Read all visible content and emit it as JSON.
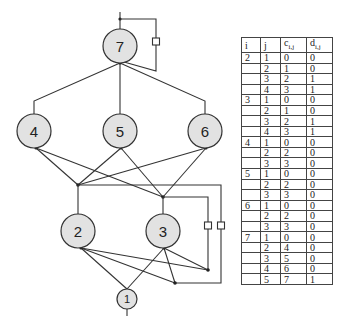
{
  "diagram": {
    "nodes": [
      {
        "id": "7",
        "label": "7",
        "cx": 120,
        "cy": 46,
        "r": 17
      },
      {
        "id": "4",
        "label": "4",
        "cx": 34,
        "cy": 131,
        "r": 17
      },
      {
        "id": "5",
        "label": "5",
        "cx": 120,
        "cy": 131,
        "r": 17
      },
      {
        "id": "6",
        "label": "6",
        "cx": 205,
        "cy": 131,
        "r": 17
      },
      {
        "id": "2",
        "label": "2",
        "cx": 78,
        "cy": 231,
        "r": 17
      },
      {
        "id": "3",
        "label": "3",
        "cx": 163,
        "cy": 231,
        "r": 17
      },
      {
        "id": "1",
        "label": "1",
        "cx": 127,
        "cy": 299,
        "r": 10
      }
    ],
    "colors": {
      "node_fill": "#e2e2e2",
      "stroke": "#333333",
      "background": "#ffffff"
    }
  },
  "table": {
    "headers": {
      "i": "i",
      "j": "j",
      "c_base": "c",
      "c_sub": "i,j",
      "d_base": "d",
      "d_sub": "i,j"
    },
    "rows": [
      {
        "i": "2",
        "j": "1",
        "c": "0",
        "d": "0"
      },
      {
        "i": "",
        "j": "2",
        "c": "1",
        "d": "0"
      },
      {
        "i": "",
        "j": "3",
        "c": "2",
        "d": "1"
      },
      {
        "i": "",
        "j": "4",
        "c": "3",
        "d": "1"
      },
      {
        "i": "3",
        "j": "1",
        "c": "0",
        "d": "0"
      },
      {
        "i": "",
        "j": "2",
        "c": "1",
        "d": "0"
      },
      {
        "i": "",
        "j": "3",
        "c": "2",
        "d": "1"
      },
      {
        "i": "",
        "j": "4",
        "c": "3",
        "d": "1"
      },
      {
        "i": "4",
        "j": "1",
        "c": "0",
        "d": "0"
      },
      {
        "i": "",
        "j": "2",
        "c": "2",
        "d": "0"
      },
      {
        "i": "",
        "j": "3",
        "c": "3",
        "d": "0"
      },
      {
        "i": "5",
        "j": "1",
        "c": "0",
        "d": "0"
      },
      {
        "i": "",
        "j": "2",
        "c": "2",
        "d": "0"
      },
      {
        "i": "",
        "j": "3",
        "c": "3",
        "d": "0"
      },
      {
        "i": "6",
        "j": "1",
        "c": "0",
        "d": "0"
      },
      {
        "i": "",
        "j": "2",
        "c": "2",
        "d": "0"
      },
      {
        "i": "",
        "j": "3",
        "c": "3",
        "d": "0"
      },
      {
        "i": "7",
        "j": "1",
        "c": "0",
        "d": "0"
      },
      {
        "i": "",
        "j": "2",
        "c": "4",
        "d": "0"
      },
      {
        "i": "",
        "j": "3",
        "c": "5",
        "d": "0"
      },
      {
        "i": "",
        "j": "4",
        "c": "6",
        "d": "0"
      },
      {
        "i": "",
        "j": "5",
        "c": "7",
        "d": "1"
      }
    ]
  }
}
